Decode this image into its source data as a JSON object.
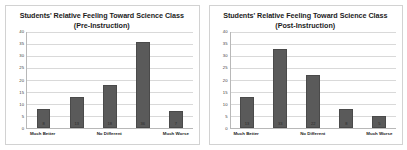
{
  "figure": {
    "background_color": "#ffffff",
    "panel_border_color": "#d2d2d2",
    "bar_color": "#5a5a5a",
    "gridline_color": "#d9d9d9",
    "axis_color": "#b8b8b8"
  },
  "chart_data": [
    {
      "type": "bar",
      "title": "Students' Relative Feeling Toward Science Class",
      "subtitle": "(Pre-Instruction)",
      "categories": [
        "Much Better",
        "",
        "No Different",
        "",
        "Much Worse"
      ],
      "tick_labels_visible": [
        "Much Better",
        "",
        "No Different",
        "",
        "Much Worse"
      ],
      "values": [
        8,
        13,
        18,
        36,
        7
      ],
      "value_labels": [
        "8",
        "13",
        "18",
        "36",
        "7"
      ],
      "xlabel": "",
      "ylabel": "",
      "ylim": [
        0,
        40
      ],
      "yticks": [
        0,
        5,
        10,
        15,
        20,
        25,
        30,
        35,
        40
      ],
      "ytick_labels": [
        "0",
        "5",
        "10",
        "15",
        "20",
        "25",
        "30",
        "35",
        "40"
      ],
      "grid": true,
      "legend": false
    },
    {
      "type": "bar",
      "title": "Students' Relative Feeling Toward Science Class",
      "subtitle": "(Post-Instruction)",
      "categories": [
        "Much Better",
        "",
        "No Different",
        "",
        "Much Worse"
      ],
      "tick_labels_visible": [
        "Much Better",
        "",
        "No Different",
        "",
        "Much Worse"
      ],
      "values": [
        13,
        33,
        22,
        8,
        5
      ],
      "value_labels": [
        "13",
        "33",
        "22",
        "8",
        "5"
      ],
      "xlabel": "",
      "ylabel": "",
      "ylim": [
        0,
        40
      ],
      "yticks": [
        0,
        5,
        10,
        15,
        20,
        25,
        30,
        35,
        40
      ],
      "ytick_labels": [
        "0",
        "5",
        "10",
        "15",
        "20",
        "25",
        "30",
        "35",
        "40"
      ],
      "grid": true,
      "legend": false
    }
  ]
}
